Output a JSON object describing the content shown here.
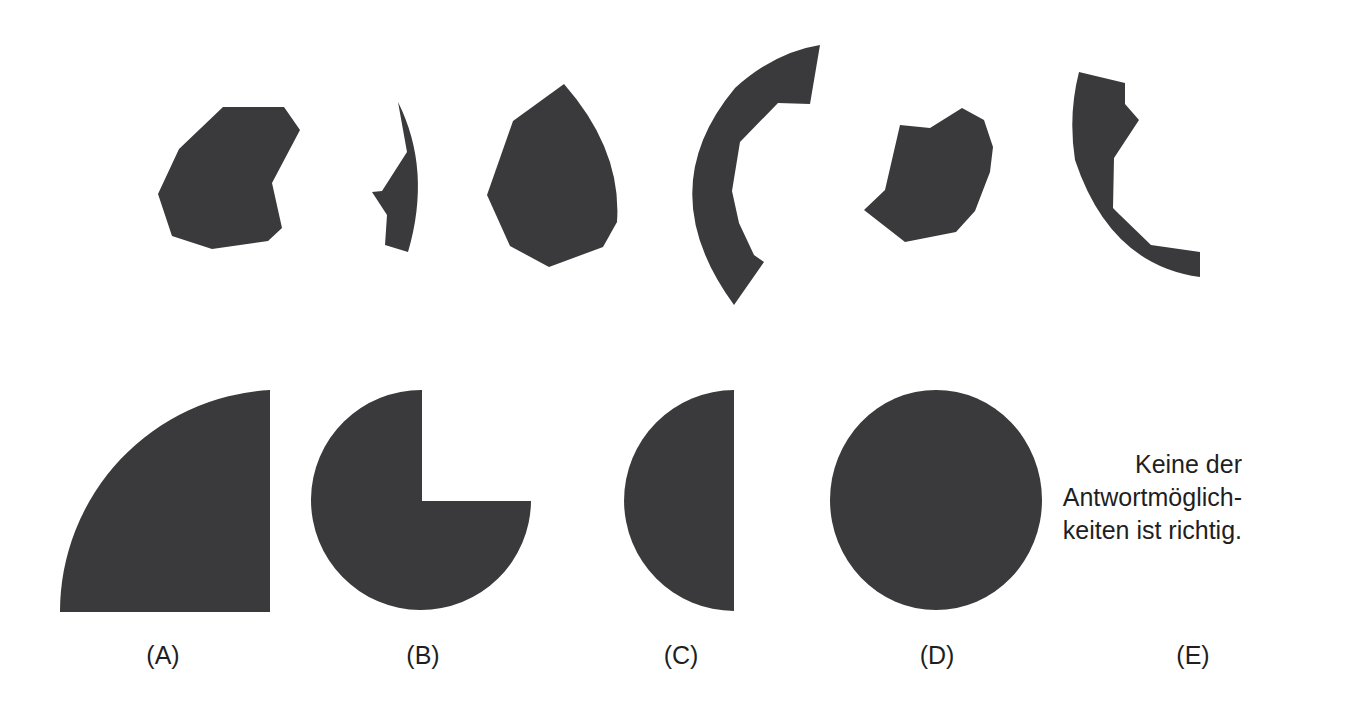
{
  "task": {
    "pieces_row_label": "Puzzle pieces",
    "pieces": [
      {
        "id": "piece-1",
        "kind": "irregular polygon"
      },
      {
        "id": "piece-2",
        "kind": "thin crescent sliver"
      },
      {
        "id": "piece-3",
        "kind": "drop-shaped polygon"
      },
      {
        "id": "piece-4",
        "kind": "thick circular arc segment"
      },
      {
        "id": "piece-5",
        "kind": "notched polygon"
      },
      {
        "id": "piece-6",
        "kind": "circular arc segment with notch"
      }
    ]
  },
  "options": [
    {
      "label": "(A)",
      "shape": "quarter-circle"
    },
    {
      "label": "(B)",
      "shape": "three-quarter-circle"
    },
    {
      "label": "(C)",
      "shape": "half-circle"
    },
    {
      "label": "(D)",
      "shape": "full-circle"
    },
    {
      "label": "(E)",
      "shape": "none",
      "text_lines": [
        "Keine der",
        "Antwortmöglich-",
        "keiten ist richtig."
      ]
    }
  ],
  "colors": {
    "shape_fill": "#3a3a3c",
    "text": "#1f1f1f",
    "background": "#ffffff"
  }
}
